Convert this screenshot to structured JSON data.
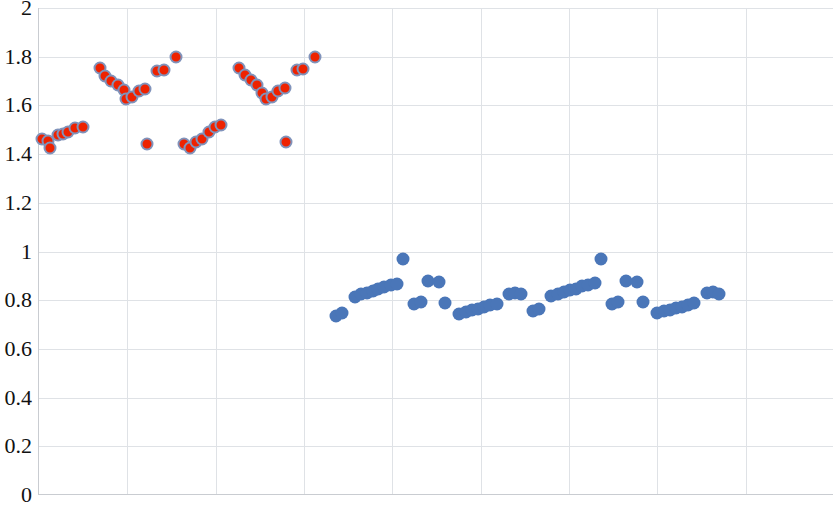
{
  "chart_data": {
    "type": "scatter",
    "title": "",
    "subtitle": "",
    "xlabel": "",
    "ylabel": "",
    "ylim": [
      0,
      2
    ],
    "ytick_labels": [
      "0",
      "0.2",
      "0.4",
      "0.6",
      "0.8",
      "1",
      "1.2",
      "1.4",
      "1.6",
      "1.8",
      "2"
    ],
    "ytick_values": [
      0,
      0.2,
      0.4,
      0.6,
      0.8,
      1,
      1.2,
      1.4,
      1.6,
      1.8,
      2
    ],
    "xlim": [
      0,
      90
    ],
    "xtick_labels": [],
    "xtick_values": [
      0,
      10,
      20,
      30,
      40,
      50,
      60,
      70,
      80,
      90
    ],
    "grid": {
      "horizontal": true,
      "vertical": true,
      "color": "#DFE2E6"
    },
    "legend": {
      "visible": false,
      "position": "none"
    },
    "annotations": [],
    "colors": {
      "series_1": "#EE2200",
      "series_1_edge": "#8093BB",
      "series_2": "#4A76B8",
      "axis": "#C9CCD1",
      "grid": "#DFE2E6"
    },
    "series": [
      {
        "name": "series-red",
        "marker": "circle",
        "color": "#EE2200",
        "edge_color": "#8093BB",
        "points": [
          [
            0.3,
            1.462
          ],
          [
            1.0,
            1.452
          ],
          [
            1.3,
            1.425
          ],
          [
            2.1,
            1.478
          ],
          [
            2.7,
            1.482
          ],
          [
            3.3,
            1.492
          ],
          [
            4.1,
            1.508
          ],
          [
            5.0,
            1.513
          ],
          [
            6.9,
            1.752
          ],
          [
            7.5,
            1.722
          ],
          [
            8.2,
            1.7
          ],
          [
            8.9,
            1.682
          ],
          [
            9.6,
            1.662
          ],
          [
            9.9,
            1.628
          ],
          [
            10.5,
            1.635
          ],
          [
            11.3,
            1.658
          ],
          [
            12.0,
            1.668
          ],
          [
            13.4,
            1.741
          ],
          [
            14.1,
            1.744
          ],
          [
            15.5,
            1.8
          ],
          [
            12.2,
            1.443
          ],
          [
            16.4,
            1.443
          ],
          [
            17.1,
            1.425
          ],
          [
            17.8,
            1.449
          ],
          [
            18.5,
            1.462
          ],
          [
            19.2,
            1.492
          ],
          [
            19.9,
            1.513
          ],
          [
            20.6,
            1.518
          ],
          [
            22.6,
            1.752
          ],
          [
            23.3,
            1.726
          ],
          [
            24.0,
            1.705
          ],
          [
            24.7,
            1.682
          ],
          [
            25.3,
            1.651
          ],
          [
            25.7,
            1.628
          ],
          [
            26.4,
            1.635
          ],
          [
            27.1,
            1.66
          ],
          [
            27.8,
            1.672
          ],
          [
            29.2,
            1.745
          ],
          [
            29.9,
            1.748
          ],
          [
            31.3,
            1.8
          ],
          [
            28.0,
            1.449
          ]
        ]
      },
      {
        "name": "series-blue",
        "marker": "circle",
        "color": "#4A76B8",
        "points": [
          [
            33.6,
            0.737
          ],
          [
            34.3,
            0.746
          ],
          [
            35.8,
            0.815
          ],
          [
            36.4,
            0.824
          ],
          [
            37.1,
            0.831
          ],
          [
            37.8,
            0.838
          ],
          [
            38.4,
            0.846
          ],
          [
            39.1,
            0.855
          ],
          [
            39.8,
            0.862
          ],
          [
            40.5,
            0.867
          ],
          [
            41.2,
            0.97
          ],
          [
            42.5,
            0.783
          ],
          [
            43.2,
            0.793
          ],
          [
            44.0,
            0.877
          ],
          [
            45.3,
            0.873
          ],
          [
            46.0,
            0.79
          ],
          [
            47.6,
            0.745
          ],
          [
            48.3,
            0.751
          ],
          [
            49.0,
            0.758
          ],
          [
            49.7,
            0.765
          ],
          [
            50.4,
            0.772
          ],
          [
            51.1,
            0.779
          ],
          [
            51.8,
            0.786
          ],
          [
            53.2,
            0.826
          ],
          [
            53.9,
            0.831
          ],
          [
            54.6,
            0.824
          ],
          [
            55.9,
            0.756
          ],
          [
            56.6,
            0.762
          ],
          [
            58.0,
            0.818
          ],
          [
            58.7,
            0.826
          ],
          [
            59.4,
            0.833
          ],
          [
            60.1,
            0.84
          ],
          [
            60.8,
            0.848
          ],
          [
            61.5,
            0.857
          ],
          [
            62.2,
            0.864
          ],
          [
            62.9,
            0.871
          ],
          [
            63.6,
            0.97
          ],
          [
            64.9,
            0.784
          ],
          [
            65.6,
            0.792
          ],
          [
            66.4,
            0.879
          ],
          [
            67.7,
            0.876
          ],
          [
            68.4,
            0.793
          ],
          [
            70.0,
            0.748
          ],
          [
            70.7,
            0.754
          ],
          [
            71.4,
            0.761
          ],
          [
            72.1,
            0.768
          ],
          [
            72.8,
            0.774
          ],
          [
            73.5,
            0.781
          ],
          [
            74.2,
            0.788
          ],
          [
            75.6,
            0.828
          ],
          [
            76.3,
            0.833
          ],
          [
            77.0,
            0.826
          ]
        ]
      }
    ]
  }
}
